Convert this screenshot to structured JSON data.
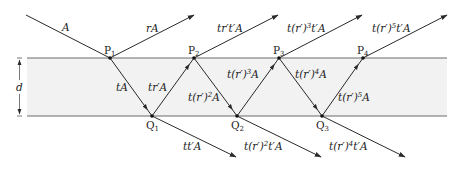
{
  "diagram": {
    "layer": {
      "thickness_label": "d",
      "fill_color": "#f2f2f2",
      "line_color": "#6a6a6a"
    },
    "incident_label": "A",
    "points_top": [
      {
        "name": "P",
        "index": "1"
      },
      {
        "name": "P",
        "index": "2"
      },
      {
        "name": "P",
        "index": "3"
      },
      {
        "name": "P",
        "index": "4"
      }
    ],
    "points_bottom": [
      {
        "name": "Q",
        "index": "1"
      },
      {
        "name": "Q",
        "index": "2"
      },
      {
        "name": "Q",
        "index": "3"
      }
    ],
    "reflected_labels": [
      {
        "pre": "rA",
        "exp": "",
        "post": ""
      },
      {
        "pre": "tr′t′A",
        "exp": "",
        "post": ""
      },
      {
        "pre": "t(r′)",
        "exp": "3",
        "post": "t′A"
      },
      {
        "pre": "t(r′)",
        "exp": "5",
        "post": "t′A"
      }
    ],
    "inner_down_labels": [
      {
        "pre": "tA",
        "exp": "",
        "post": ""
      },
      {
        "pre": "t(r′)",
        "exp": "2",
        "post": "A"
      },
      {
        "pre": "t(r′)",
        "exp": "4",
        "post": "A"
      }
    ],
    "inner_up_labels": [
      {
        "pre": "tr′A",
        "exp": "",
        "post": ""
      },
      {
        "pre": "t(r′)",
        "exp": "3",
        "post": "A"
      },
      {
        "pre": "t(r′)",
        "exp": "5",
        "post": "A"
      }
    ],
    "transmitted_labels": [
      {
        "pre": "tt′A",
        "exp": "",
        "post": ""
      },
      {
        "pre": "t(r′)",
        "exp": "2",
        "post": "t′A"
      },
      {
        "pre": "t(r′)",
        "exp": "4",
        "post": "t′A"
      }
    ]
  }
}
